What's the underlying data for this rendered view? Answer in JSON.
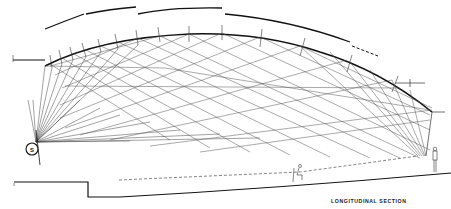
{
  "figure": {
    "caption": "LONGITUDINAL SECTION",
    "source_label": "S",
    "source_meaning": "sound source",
    "colors": {
      "background": "#ffffff",
      "ink": "#111111",
      "ray": "#444444"
    }
  },
  "elements": {
    "ceiling_profile": "curved reflective ceiling",
    "outer_roof_segments": 4,
    "ray_fan_origin": "S",
    "floor": "raked seating floor",
    "sightline": "dashed line",
    "figures": [
      "seated person",
      "standing person"
    ]
  }
}
